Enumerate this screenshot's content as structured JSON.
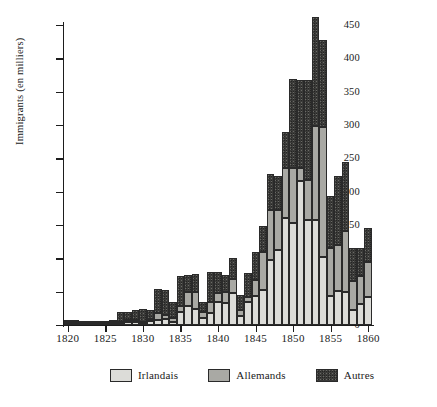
{
  "chart_data": {
    "type": "bar",
    "stacked": true,
    "title": "",
    "xlabel": "",
    "ylabel": "Immigrants (en milliers)",
    "xlim": [
      1819.5,
      1860.5
    ],
    "ylim": [
      0,
      450
    ],
    "ytick_values": [
      0,
      50,
      100,
      150,
      200,
      250,
      300,
      350,
      400,
      450
    ],
    "ytick_labels": [
      "0",
      "50",
      "100",
      "150",
      "200",
      "250",
      "300",
      "350",
      "400",
      "450"
    ],
    "xtick_values": [
      1820,
      1825,
      1830,
      1835,
      1840,
      1845,
      1850,
      1855,
      1860
    ],
    "xtick_labels": [
      "1820",
      "1825",
      "1830",
      "1835",
      "1840",
      "1845",
      "1850",
      "1855",
      "1860"
    ],
    "grid": false,
    "legend_position": "bottom",
    "categories": [
      1820,
      1821,
      1822,
      1823,
      1824,
      1825,
      1826,
      1827,
      1828,
      1829,
      1830,
      1831,
      1832,
      1833,
      1834,
      1835,
      1836,
      1837,
      1838,
      1839,
      1840,
      1841,
      1842,
      1843,
      1844,
      1845,
      1846,
      1847,
      1848,
      1849,
      1850,
      1851,
      1852,
      1853,
      1854,
      1855,
      1856,
      1857,
      1858,
      1859,
      1860
    ],
    "series": [
      {
        "name": "Irlandais",
        "color": "#dcdcd8",
        "values": [
          4,
          4,
          3,
          3,
          3,
          3,
          3,
          4,
          5,
          5,
          3,
          6,
          7,
          9,
          5,
          20,
          28,
          24,
          11,
          18,
          35,
          33,
          48,
          14,
          34,
          44,
          52,
          98,
          112,
          160,
          153,
          216,
          157,
          157,
          102,
          44,
          51,
          49,
          22,
          31,
          42
        ]
      },
      {
        "name": "Allemands",
        "color": "#a9a9a4",
        "values": [
          1,
          1,
          1,
          1,
          1,
          1,
          1,
          1,
          2,
          2,
          2,
          3,
          11,
          6,
          5,
          9,
          21,
          26,
          8,
          16,
          13,
          16,
          21,
          8,
          8,
          23,
          58,
          75,
          60,
          76,
          83,
          19,
          60,
          141,
          195,
          72,
          69,
          92,
          44,
          42,
          53
        ]
      },
      {
        "name": "Autres",
        "color": "#3c3c3a",
        "values": [
          3,
          3,
          2,
          2,
          2,
          2,
          3,
          15,
          13,
          15,
          19,
          13,
          36,
          37,
          24,
          44,
          26,
          26,
          15,
          45,
          31,
          26,
          31,
          23,
          36,
          42,
          38,
          53,
          52,
          54,
          133,
          133,
          150,
          164,
          131,
          77,
          104,
          103,
          49,
          42,
          51
        ]
      }
    ]
  },
  "axes": {
    "y_label": "Immigrants (en milliers)"
  },
  "legend": {
    "items": [
      {
        "label": "Irlandais",
        "swatch": "irlandais"
      },
      {
        "label": "Allemands",
        "swatch": "allemands"
      },
      {
        "label": "Autres",
        "swatch": "autres"
      }
    ]
  }
}
